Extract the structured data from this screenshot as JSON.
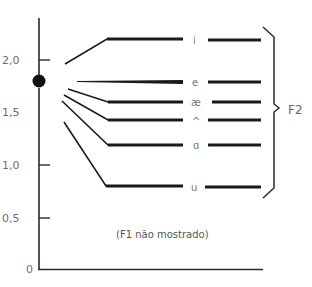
{
  "diagram": {
    "y_axis": {
      "ticks": [
        {
          "label": "2,0",
          "value": 2.0
        },
        {
          "label": "1,5",
          "value": 1.5
        },
        {
          "label": "1,0",
          "value": 1.0
        },
        {
          "label": "0,5",
          "value": 0.5
        },
        {
          "label": "0",
          "value": 0
        }
      ]
    },
    "start_point": {
      "value": 1.8
    },
    "formants": [
      {
        "vowel": "i",
        "value": 2.2
      },
      {
        "vowel": "e",
        "value": 1.8
      },
      {
        "vowel": "æ",
        "value": 1.62
      },
      {
        "vowel": "^",
        "value": 1.45
      },
      {
        "vowel": "ɑ",
        "value": 1.2
      },
      {
        "vowel": "u",
        "value": 0.8
      }
    ],
    "brace_label": "F2",
    "note": "(F1 não mostrado)",
    "colors": {
      "line": "#1a1a1a",
      "text": "#6e6e6e",
      "background": "#ffffff"
    }
  }
}
